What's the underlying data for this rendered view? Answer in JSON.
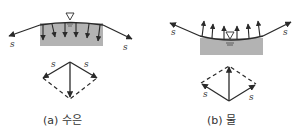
{
  "figure": {
    "panels": [
      {
        "id": "a",
        "caption": "(a) 수은",
        "surface": "convex",
        "force_direction": "down",
        "tension_label_left": "s",
        "tension_label_right": "s",
        "vector_label_left": "s",
        "vector_label_right": "s"
      },
      {
        "id": "b",
        "caption": "(b) 물",
        "surface": "concave",
        "force_direction": "up",
        "tension_label_left": "s",
        "tension_label_right": "s",
        "vector_label_left": "s",
        "vector_label_right": "s"
      }
    ],
    "colors": {
      "fluid_fill": "#b3b3b3",
      "line": "#2a2a2a",
      "background": "#ffffff"
    }
  }
}
